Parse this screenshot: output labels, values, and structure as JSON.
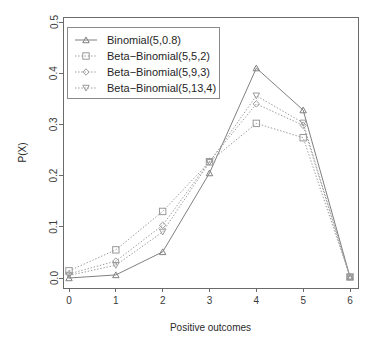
{
  "chart_data": {
    "type": "line",
    "title": "",
    "xlabel": "Positive outcomes",
    "ylabel": "P(X)",
    "x": [
      0,
      1,
      2,
      3,
      4,
      5,
      6
    ],
    "xtick_labels": [
      "0",
      "1",
      "2",
      "3",
      "4",
      "5",
      "6"
    ],
    "ytick_labels": [
      "0.0",
      "0.1",
      "0.2",
      "0.3",
      "0.4",
      "0.5"
    ],
    "ytick_values": [
      0.0,
      0.1,
      0.2,
      0.3,
      0.4,
      0.5
    ],
    "xlim": [
      0,
      6
    ],
    "ylim": [
      0.0,
      0.5
    ],
    "grid": false,
    "legend_position": "top-left",
    "series": [
      {
        "name": "Binomial(5,0.8)",
        "marker": "triangle-up",
        "linestyle": "solid",
        "color": "#808080",
        "values": [
          0.0,
          0.006,
          0.051,
          0.205,
          0.41,
          0.328,
          0.002
        ]
      },
      {
        "name": "Beta-Binomial(5,5,2)",
        "marker": "square",
        "linestyle": "dotted",
        "color": "#9a9a9a",
        "values": [
          0.014,
          0.055,
          0.13,
          0.227,
          0.302,
          0.274,
          0.002
        ]
      },
      {
        "name": "Beta-Binomial(5,9,3)",
        "marker": "diamond",
        "linestyle": "dotted",
        "color": "#9a9a9a",
        "values": [
          0.008,
          0.033,
          0.103,
          0.228,
          0.34,
          0.298,
          0.002
        ]
      },
      {
        "name": "Beta-Binomial(5,13,4)",
        "marker": "triangle-down",
        "linestyle": "dotted",
        "color": "#9a9a9a",
        "values": [
          0.005,
          0.025,
          0.09,
          0.226,
          0.356,
          0.303,
          0.002
        ]
      }
    ]
  },
  "plot_geometry": {
    "left": 63,
    "right": 358,
    "top": 17,
    "bottom": 288,
    "x0_px": 69,
    "x6_px": 350,
    "y_zero_px": 278,
    "y_max_px": 22
  },
  "legend": {
    "box": {
      "x": 67,
      "y": 27,
      "width": 152,
      "height": 71
    }
  }
}
